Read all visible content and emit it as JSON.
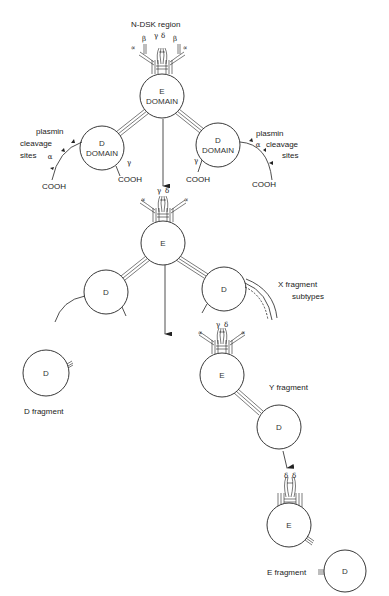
{
  "title_label": "N-DSK region",
  "fibrinogen": {
    "e_domain": {
      "line1": "E",
      "line2": "DOMAIN"
    },
    "d_domain_left": {
      "line1": "D",
      "line2": "DOMAIN"
    },
    "d_domain_right": {
      "line1": "D",
      "line2": "DOMAIN"
    },
    "left_cleavage": {
      "line1": "plasmin",
      "line2": "cleavage",
      "line3": "sites",
      "alpha": "α"
    },
    "right_cleavage": {
      "line1": "plasmin",
      "line2": "cleavage",
      "line3": "sites",
      "alpha": "α"
    },
    "cooh_labels": [
      "COOH",
      "COOH",
      "COOH",
      "COOH"
    ],
    "gamma_labels": [
      "γ",
      "γ"
    ],
    "chain_labels_top": [
      "α",
      "β",
      "γ",
      "δ",
      "β",
      "α"
    ]
  },
  "x_fragment": {
    "e_label": "E",
    "d_left_label": "D",
    "d_right_label": "D",
    "caption_line1": "X fragment",
    "caption_line2": "subtypes"
  },
  "d_fragment": {
    "label": "D",
    "caption": "D fragment"
  },
  "y_fragment": {
    "e_label": "E",
    "d_label": "D",
    "caption": "Y fragment"
  },
  "e_fragment": {
    "e_label": "E",
    "d_label": "D",
    "caption": "E fragment"
  },
  "colors": {
    "ink": "#222222",
    "background": "#ffffff"
  }
}
